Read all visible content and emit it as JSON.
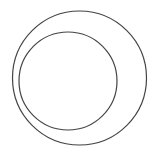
{
  "canvas": {
    "width": 151,
    "height": 156,
    "background": "#ffffff"
  },
  "diagram": {
    "stroke_color": "#444444",
    "stroke_width": 1.2,
    "shapes": [
      {
        "name": "outer-circle",
        "cx": 79.5,
        "cy": 78,
        "r": 67
      },
      {
        "name": "inner-circle",
        "cx": 68,
        "cy": 81,
        "r": 49
      }
    ]
  }
}
